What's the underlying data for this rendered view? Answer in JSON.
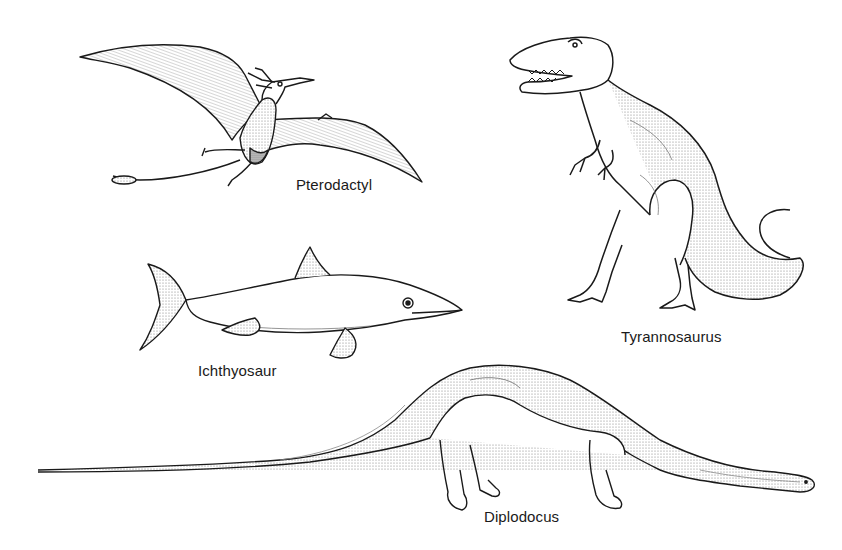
{
  "figure": {
    "type": "illustration-plate",
    "style": "black-and-white stippled line drawing",
    "colors": {
      "background": "#ffffff",
      "ink": "#1a1a1a",
      "stipple": "#8a8a8a"
    }
  },
  "specimens": [
    {
      "id": "pterodactyl",
      "label": "Pterodactyl",
      "pose": "flying, wings spread"
    },
    {
      "id": "tyrannosaurus",
      "label": "Tyrannosaurus",
      "pose": "standing upright, jaws open"
    },
    {
      "id": "ichthyosaur",
      "label": "Ichthyosaur",
      "pose": "swimming, side view"
    },
    {
      "id": "diplodocus",
      "label": "Diplodocus",
      "pose": "walking, long neck and tail extended"
    }
  ]
}
